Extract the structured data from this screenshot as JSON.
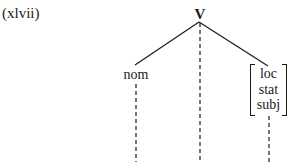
{
  "example": {
    "number_label": "(xlvii)"
  },
  "tree": {
    "root": {
      "label": "V"
    },
    "children": [
      {
        "label": "nom"
      },
      {
        "features": [
          "loc",
          "stat",
          "subj"
        ]
      }
    ],
    "association_lines": {
      "style": "dashed",
      "count": 3
    }
  },
  "colors": {
    "ink": "#1a1a1a",
    "background": "#ffffff"
  }
}
